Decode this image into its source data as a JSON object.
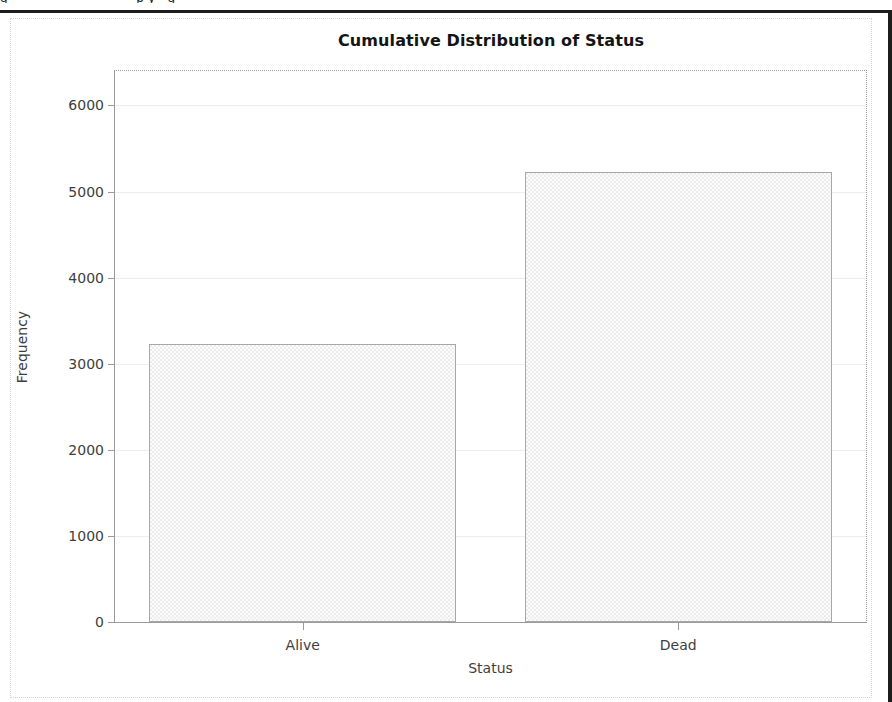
{
  "window": {
    "clipped_header_text": "g                                p y   g",
    "border_color": "#1c1c1c",
    "panel_border_color": "#d2d2d2"
  },
  "chart_data": {
    "type": "bar",
    "title": "Cumulative Distribution of Status",
    "xlabel": "Status",
    "ylabel": "Frequency",
    "categories": [
      "Alive",
      "Dead"
    ],
    "values": [
      3230,
      5230
    ],
    "ylim": [
      0,
      6400
    ],
    "yticks": [
      0,
      1000,
      2000,
      3000,
      4000,
      5000,
      6000
    ],
    "ytick_labels": [
      "0",
      "1000",
      "2000",
      "3000",
      "4000",
      "5000",
      "6000"
    ],
    "grid": true,
    "legend": "none",
    "bar_fill": "#ececec",
    "bar_edge": "#a8a8a8",
    "axis_color": "#9a9a9a",
    "gridline_color": "#ededed",
    "text_color": "#3e3e3e",
    "title_color": "#141414"
  }
}
